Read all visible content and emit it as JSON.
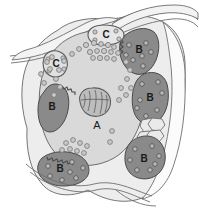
{
  "figure": {
    "background_color": "#ffffff",
    "width": 199,
    "height": 214
  },
  "palette": {
    "outline": "#6e6e6e",
    "outline_dark": "#4a4a4a",
    "cytoplasm": "#d9d9d9",
    "outer_sheath": "#ededed",
    "dark_cell": "#8a8a8a",
    "dark_cell_alt": "#9a9a9a",
    "nucleus": "#bdbdbd",
    "granule_fill": "#c9c9c9",
    "granule_stroke": "#7a7a7a",
    "vesicle_fill": "#b3b3b3",
    "mosaic_fill": "#e3e3e3",
    "label_color": "#1a1a1a"
  },
  "labels": {
    "center_cell": "A",
    "dark_cell_top_right": "B",
    "dark_cell_right_mid": "B",
    "dark_cell_bottom_right": "B",
    "dark_cell_left": "B",
    "dark_cell_bottom_left": "B",
    "process_top": "C",
    "process_left": "C"
  },
  "structures": {
    "center_cell_label": "A",
    "dark_cell_label": "B",
    "process_label": "C",
    "nucleus_name": "nucleus",
    "granule_name": "granule",
    "mosaic_name": "polygonal-cell-cluster",
    "ruffled_border_name": "ruffled-border"
  },
  "granules": {
    "central_cluster": [
      {
        "cx": 86,
        "cy": 45,
        "r": 2.6
      },
      {
        "cx": 94,
        "cy": 43,
        "r": 2.6
      },
      {
        "cx": 101,
        "cy": 44,
        "r": 2.4
      },
      {
        "cx": 108,
        "cy": 45,
        "r": 2.6
      },
      {
        "cx": 114,
        "cy": 47,
        "r": 2.4
      },
      {
        "cx": 90,
        "cy": 52,
        "r": 2.6
      },
      {
        "cx": 97,
        "cy": 51,
        "r": 2.4
      },
      {
        "cx": 104,
        "cy": 51,
        "r": 2.6
      },
      {
        "cx": 111,
        "cy": 52,
        "r": 2.4
      },
      {
        "cx": 118,
        "cy": 53,
        "r": 2.4
      },
      {
        "cx": 93,
        "cy": 58,
        "r": 2.4
      },
      {
        "cx": 100,
        "cy": 58,
        "r": 2.6
      },
      {
        "cx": 107,
        "cy": 58,
        "r": 2.4
      },
      {
        "cx": 114,
        "cy": 59,
        "r": 2.4
      },
      {
        "cx": 79,
        "cy": 49,
        "r": 2.4
      },
      {
        "cx": 72,
        "cy": 54,
        "r": 2.4
      },
      {
        "cx": 64,
        "cy": 61,
        "r": 2.4
      },
      {
        "cx": 59,
        "cy": 70,
        "r": 2.4
      },
      {
        "cx": 56,
        "cy": 79,
        "r": 2.4
      },
      {
        "cx": 60,
        "cy": 87,
        "r": 2.4
      },
      {
        "cx": 54,
        "cy": 95,
        "r": 2.4
      },
      {
        "cx": 50,
        "cy": 69,
        "r": 2.4
      },
      {
        "cx": 47,
        "cy": 62,
        "r": 2.4
      },
      {
        "cx": 52,
        "cy": 57,
        "r": 2.4
      },
      {
        "cx": 126,
        "cy": 62,
        "r": 2.4
      },
      {
        "cx": 130,
        "cy": 70,
        "r": 2.4
      },
      {
        "cx": 127,
        "cy": 79,
        "r": 2.4
      },
      {
        "cx": 131,
        "cy": 88,
        "r": 2.4
      },
      {
        "cx": 126,
        "cy": 95,
        "r": 2.4
      },
      {
        "cx": 121,
        "cy": 88,
        "r": 2.4
      },
      {
        "cx": 119,
        "cy": 100,
        "r": 2.4
      },
      {
        "cx": 112,
        "cy": 131,
        "r": 2.4
      },
      {
        "cx": 110,
        "cy": 142,
        "r": 2.4
      },
      {
        "cx": 66,
        "cy": 143,
        "r": 2.4
      },
      {
        "cx": 73,
        "cy": 140,
        "r": 2.4
      },
      {
        "cx": 80,
        "cy": 143,
        "r": 2.4
      },
      {
        "cx": 87,
        "cy": 146,
        "r": 2.4
      },
      {
        "cx": 62,
        "cy": 150,
        "r": 2.4
      },
      {
        "cx": 70,
        "cy": 149,
        "r": 2.4
      },
      {
        "cx": 77,
        "cy": 151,
        "r": 2.4
      },
      {
        "cx": 84,
        "cy": 153,
        "r": 2.4
      },
      {
        "cx": 41,
        "cy": 74,
        "r": 2.4
      },
      {
        "cx": 44,
        "cy": 83,
        "r": 2.4
      }
    ]
  },
  "accessibility": {
    "alt_text": "Schematic cross-section of a large central cell labeled A containing a nucleus and numerous granules, surrounded by five darker cells labeled B with ruffled borders and internal vesicles, and two elongated processes labeled C."
  }
}
